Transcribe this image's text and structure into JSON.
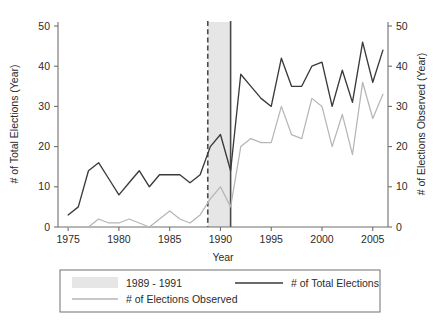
{
  "chart_data": {
    "type": "line",
    "title": "",
    "xlabel": "Year",
    "ylabel": "# of Total Elections (Year)",
    "y2label": "# of Elections Observed (Year)",
    "xlim": [
      1974,
      2006.5
    ],
    "ylim": [
      0,
      51
    ],
    "y2lim": [
      0,
      51
    ],
    "grid": false,
    "legend_position": "bottom",
    "xticks": [
      1975,
      1980,
      1985,
      1990,
      1995,
      2000,
      2005
    ],
    "xtick_labels": [
      "1975",
      "1980",
      "1985",
      "1990",
      "1995",
      "2000",
      "2005"
    ],
    "yticks": [
      0,
      10,
      20,
      30,
      40,
      50
    ],
    "ytick_labels": [
      "0",
      "10",
      "20",
      "30",
      "40",
      "50"
    ],
    "y2ticks": [
      0,
      10,
      20,
      30,
      40,
      50
    ],
    "y2tick_labels": [
      "0",
      "10",
      "20",
      "30",
      "40",
      "50"
    ],
    "x": [
      1975,
      1976,
      1977,
      1978,
      1979,
      1980,
      1981,
      1982,
      1983,
      1984,
      1985,
      1986,
      1987,
      1988,
      1989,
      1990,
      1991,
      1992,
      1993,
      1994,
      1995,
      1996,
      1997,
      1998,
      1999,
      2000,
      2001,
      2002,
      2003,
      2004,
      2005,
      2006
    ],
    "series": [
      {
        "name": "# of Total Elections",
        "color": "#3a3a3a",
        "style": "solid",
        "axis": "left",
        "values": [
          3,
          5,
          14,
          16,
          12,
          8,
          11,
          14,
          10,
          13,
          13,
          13,
          11,
          13,
          20,
          23,
          14,
          38,
          35,
          32,
          30,
          42,
          35,
          35,
          40,
          41,
          30,
          39,
          31,
          46,
          36,
          44
        ]
      },
      {
        "name": "# of Elections Observed",
        "color": "#b6b6b6",
        "style": "solid",
        "axis": "right",
        "values": [
          0,
          0,
          0,
          2,
          1,
          1,
          2,
          1,
          0,
          2,
          4,
          2,
          1,
          3,
          7,
          10,
          5,
          20,
          22,
          21,
          21,
          30,
          23,
          22,
          32,
          30,
          20,
          28,
          18,
          36,
          27,
          33
        ]
      }
    ],
    "annotations": [
      {
        "type": "vline",
        "style": "dashed",
        "x": 1988.75,
        "label": "transition start"
      },
      {
        "type": "vline",
        "style": "solid",
        "x": 1991.0,
        "label": "transition end"
      },
      {
        "type": "vband",
        "x0": 1988.75,
        "x1": 1991.0,
        "color": "#e6e6e6",
        "label": "1989 - 1991"
      }
    ]
  },
  "legend": {
    "items": [
      {
        "label": "1989 - 1991",
        "marker": "patch",
        "color": "#e6e6e6"
      },
      {
        "label": "# of Total Elections",
        "marker": "line",
        "color": "#3a3a3a"
      },
      {
        "label": "# of Elections Observed",
        "marker": "line",
        "color": "#b6b6b6"
      }
    ]
  },
  "axes": {
    "x_title": "Year",
    "y_left_title": "# of Total Elections (Year)",
    "y_right_title": "# of Elections Observed (Year)"
  }
}
